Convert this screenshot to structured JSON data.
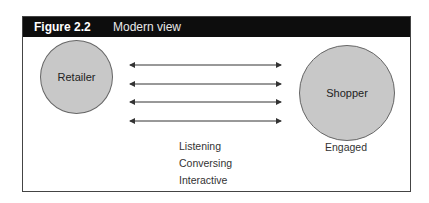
{
  "figure": {
    "number": "Figure 2.2",
    "title": "Modern view"
  },
  "nodes": {
    "retailer": "Retailer",
    "shopper": "Shopper"
  },
  "shopper_caption": "Engaged",
  "interaction_labels": [
    "Listening",
    "Conversing",
    "Interactive"
  ],
  "arrows": {
    "count": 4,
    "type": "bidirectional",
    "color": "#333333"
  },
  "colors": {
    "header_bg": "#0d0d0d",
    "circle_fill": "#c8c8c8",
    "border": "#444444"
  }
}
